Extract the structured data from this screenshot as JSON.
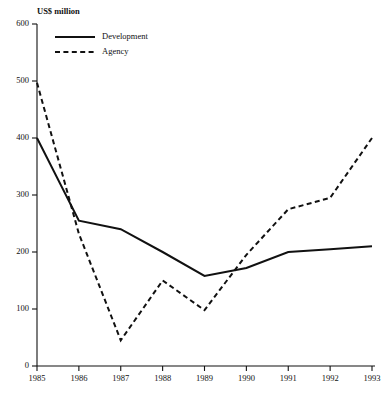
{
  "chart_data": {
    "type": "line",
    "title": "US$ million",
    "xlabel": "",
    "ylabel": "US$ million",
    "x": [
      1985,
      1986,
      1987,
      1988,
      1989,
      1990,
      1991,
      1992,
      1993
    ],
    "categories": [
      "1985",
      "1986",
      "1987",
      "1988",
      "1989",
      "1990",
      "1991",
      "1992",
      "1993"
    ],
    "series": [
      {
        "name": "Development",
        "style": "solid",
        "values": [
          400,
          255,
          240,
          200,
          158,
          172,
          200,
          205,
          210
        ]
      },
      {
        "name": "Agency",
        "style": "dashed",
        "values": [
          497,
          232,
          45,
          150,
          98,
          195,
          275,
          295,
          400
        ]
      }
    ],
    "ylim": [
      0,
      600
    ],
    "yticks": [
      0,
      100,
      200,
      300,
      400,
      500,
      600
    ],
    "ytick_labels": [
      "0",
      "100",
      "200",
      "300",
      "400",
      "500",
      "600"
    ],
    "xtick_labels": [
      "1985",
      "1986",
      "1987",
      "1988",
      "1989",
      "1990",
      "1991",
      "1992",
      "1993"
    ],
    "grid": false,
    "legend_position": "top-left-inside",
    "line_color": "#111111"
  },
  "legend": {
    "entries": [
      {
        "label": "Development",
        "style": "solid"
      },
      {
        "label": "Agency",
        "style": "dashed"
      }
    ]
  },
  "axis": {
    "y_title": "US$ million"
  }
}
